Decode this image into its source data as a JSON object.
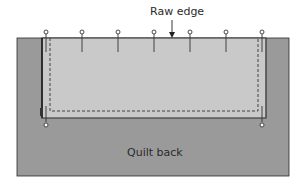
{
  "diagram": {
    "labels": {
      "raw_edge": "Raw edge",
      "quilt_back": "Quilt back"
    },
    "colors": {
      "quilt_back": "#9a9a9a",
      "binding_fabric": "#c8c8c8",
      "outline": "#2a2a2a",
      "background": "#ffffff"
    },
    "pins": {
      "top_count": 7,
      "bottom_count": 2
    },
    "elements": [
      "quilt-back",
      "binding-strip",
      "stitch-line",
      "pins",
      "raw-edge-arrow"
    ]
  }
}
